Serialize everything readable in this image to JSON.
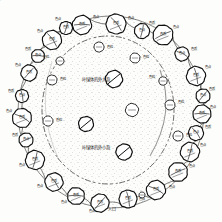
{
  "figure": {
    "background_color": "#fdfdfb",
    "ink_color": "#111111",
    "center_labels": [
      {
        "text": "叶绿体的外大泡",
        "x": 96,
        "y": 80
      },
      {
        "text": "叶绿体的外小泡",
        "x": 96,
        "y": 148
      }
    ],
    "bottom_label": {
      "text": "入口",
      "x": 112,
      "y": 210
    },
    "inner_structures": [
      {
        "name": "granule-upper-small",
        "label": "色粒",
        "cx": 99,
        "cy": 47,
        "r": 5.0,
        "lx": 110,
        "ly": 48
      },
      {
        "name": "granule-upper-right",
        "label": "色粒",
        "cx": 135,
        "cy": 58,
        "r": 5.0,
        "lx": 146,
        "ly": 58
      },
      {
        "name": "granule-slashed-large",
        "label": "",
        "cx": 114,
        "cy": 79,
        "r": 8.5,
        "lx": 0,
        "ly": 0
      },
      {
        "name": "granule-left-mid",
        "label": "色粒",
        "cx": 52,
        "cy": 80,
        "r": 5.0,
        "lx": 63,
        "ly": 80
      },
      {
        "name": "granule-left-low",
        "label": "色粒",
        "cx": 48,
        "cy": 121,
        "r": 5.0,
        "lx": 59,
        "ly": 121
      },
      {
        "name": "granule-center-ring",
        "label": "",
        "cx": 86,
        "cy": 124,
        "r": 7.5,
        "lx": 0,
        "ly": 0
      },
      {
        "name": "granule-right-mid",
        "label": "色粒",
        "cx": 132,
        "cy": 110,
        "r": 6.5,
        "lx": 0,
        "ly": 0
      },
      {
        "name": "granule-right-low",
        "label": "色粒",
        "cx": 170,
        "cy": 105,
        "r": 5.0,
        "lx": 181,
        "ly": 103
      },
      {
        "name": "granule-lower-right",
        "label": "色粒",
        "cx": 178,
        "cy": 136,
        "r": 5.0,
        "lx": 189,
        "ly": 136
      },
      {
        "name": "granule-bottom-center",
        "label": "",
        "cx": 124,
        "cy": 152,
        "r": 8.0,
        "lx": 0,
        "ly": 0
      },
      {
        "name": "granule-tiny-bottom",
        "label": "",
        "cx": 142,
        "cy": 195,
        "r": 3.0,
        "lx": 0,
        "ly": 0
      },
      {
        "name": "granule-inner-left",
        "label": "色粒",
        "cx": 60,
        "cy": 61,
        "r": 4.0,
        "lx": 46,
        "ly": 58
      },
      {
        "name": "granule-inner-rt",
        "label": "色粒",
        "cx": 163,
        "cy": 81,
        "r": 4.2,
        "lx": 152,
        "ly": 78
      }
    ],
    "ring_cells": [
      {
        "name": "cell-01",
        "label": "色质",
        "tag": "色点",
        "cx": 82,
        "cy": 25,
        "r": 9.5,
        "tx": 96,
        "ty": 18
      },
      {
        "name": "cell-02",
        "label": "色质",
        "tag": "色点",
        "cx": 116,
        "cy": 24,
        "r": 10.0,
        "tx": 131,
        "ty": 19
      },
      {
        "name": "cell-03",
        "label": "色点",
        "tag": "色质",
        "cx": 142,
        "cy": 31,
        "r": 7.5,
        "tx": 152,
        "ty": 24
      },
      {
        "name": "cell-04",
        "label": "色质",
        "tag": "色点",
        "cx": 163,
        "cy": 35,
        "r": 10.0,
        "tx": 176,
        "ty": 28
      },
      {
        "name": "cell-05",
        "label": "色点",
        "tag": "色质",
        "cx": 182,
        "cy": 54,
        "r": 7.0,
        "tx": 194,
        "ty": 50
      },
      {
        "name": "cell-06",
        "label": "色质",
        "tag": "色点",
        "cx": 196,
        "cy": 76,
        "r": 9.5,
        "tx": 208,
        "ty": 68
      },
      {
        "name": "cell-07",
        "label": "色点",
        "tag": "色质",
        "cx": 203,
        "cy": 96,
        "r": 7.0,
        "tx": 212,
        "ty": 90
      },
      {
        "name": "cell-08",
        "label": "色质",
        "tag": "色点",
        "cx": 202,
        "cy": 114,
        "r": 9.0,
        "tx": 213,
        "ty": 108
      },
      {
        "name": "cell-09",
        "label": "色点",
        "tag": "色质",
        "cx": 196,
        "cy": 133,
        "r": 7.5,
        "tx": 208,
        "ty": 128
      },
      {
        "name": "cell-10",
        "label": "色质",
        "tag": "色点",
        "cx": 190,
        "cy": 152,
        "r": 9.5,
        "tx": 203,
        "ty": 146
      },
      {
        "name": "cell-11",
        "label": "色质",
        "tag": "色点",
        "cx": 178,
        "cy": 172,
        "r": 9.5,
        "tx": 192,
        "ty": 167
      },
      {
        "name": "cell-12",
        "label": "色质",
        "tag": "色点",
        "cx": 156,
        "cy": 190,
        "r": 9.5,
        "tx": 172,
        "ty": 188
      },
      {
        "name": "cell-13",
        "label": "色质",
        "tag": "色点",
        "cx": 128,
        "cy": 199,
        "r": 9.0,
        "tx": 142,
        "ty": 200
      },
      {
        "name": "cell-14",
        "label": "色质",
        "tag": "色点",
        "cx": 100,
        "cy": 203,
        "r": 9.0,
        "tx": 92,
        "ty": 212
      },
      {
        "name": "cell-15",
        "label": "色质",
        "tag": "色点",
        "cx": 76,
        "cy": 196,
        "r": 8.5,
        "tx": 64,
        "ty": 203
      },
      {
        "name": "cell-16",
        "label": "色质",
        "tag": "色点",
        "cx": 54,
        "cy": 182,
        "r": 9.0,
        "tx": 40,
        "ty": 187
      },
      {
        "name": "cell-17",
        "label": "色质",
        "tag": "色点",
        "cx": 35,
        "cy": 160,
        "r": 9.5,
        "tx": 22,
        "ty": 166
      },
      {
        "name": "cell-18",
        "label": "色点",
        "tag": "色质",
        "cx": 26,
        "cy": 140,
        "r": 7.0,
        "tx": 15,
        "ty": 136
      },
      {
        "name": "cell-19",
        "label": "色质",
        "tag": "色点",
        "cx": 22,
        "cy": 118,
        "r": 9.5,
        "tx": 9,
        "ty": 112
      },
      {
        "name": "cell-20",
        "label": "色点",
        "tag": "色质",
        "cx": 22,
        "cy": 96,
        "r": 6.5,
        "tx": 11,
        "ty": 92
      },
      {
        "name": "cell-21",
        "label": "色质",
        "tag": "色点",
        "cx": 29,
        "cy": 73,
        "r": 8.0,
        "tx": 18,
        "ty": 66
      },
      {
        "name": "cell-22",
        "label": "色点",
        "tag": "色质",
        "cx": 38,
        "cy": 56,
        "r": 6.5,
        "tx": 28,
        "ty": 50
      },
      {
        "name": "cell-23",
        "label": "色质",
        "tag": "色点",
        "cx": 52,
        "cy": 40,
        "r": 9.5,
        "tx": 40,
        "ty": 32
      },
      {
        "name": "cell-24",
        "label": "色质",
        "tag": "色点",
        "cx": 66,
        "cy": 28,
        "r": 6.5,
        "tx": 58,
        "ty": 20
      }
    ]
  }
}
